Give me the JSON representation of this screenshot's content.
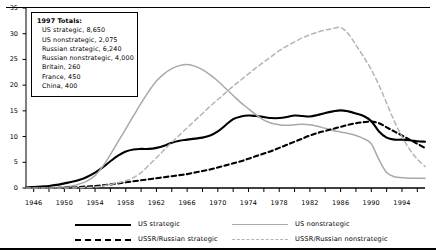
{
  "info_box": {
    "title": "1997 Totals:",
    "items": [
      "US strategic, 8,650",
      "US nonstrategic, 2,075",
      "Russian strategic, 6,240",
      "Russian nonstrategic, 4,000",
      "Britain, 260",
      "France, 450",
      "China, 400"
    ]
  },
  "legend": [
    {
      "label": "US strategic",
      "style": "solid-black"
    },
    {
      "label": "US nonstrategic",
      "style": "solid-gray"
    },
    {
      "label": "USSR/Russian strategic",
      "style": "dash-black"
    },
    {
      "label": "USSR/Russian nonstrategic",
      "style": "dash-gray"
    }
  ],
  "colors": {
    "us_strategic": "#000000",
    "us_nonstrategic": "#a9a9a9",
    "ussr_strategic": "#000000",
    "ussr_nonstrategic": "#b4b4b4",
    "axis": "#000000"
  },
  "chart_data": {
    "type": "line",
    "title": "",
    "xlabel": "",
    "ylabel": "",
    "xlim": [
      1945,
      1997
    ],
    "ylim": [
      0,
      35
    ],
    "grid": false,
    "legend_position": "bottom",
    "xticks": [
      1946,
      1950,
      1954,
      1958,
      1962,
      1966,
      1970,
      1974,
      1978,
      1982,
      1986,
      1990,
      1994
    ],
    "yticks": [
      0,
      5,
      10,
      15,
      20,
      25,
      30,
      35
    ],
    "x": [
      1945,
      1946,
      1947,
      1948,
      1949,
      1950,
      1951,
      1952,
      1953,
      1954,
      1955,
      1956,
      1957,
      1958,
      1959,
      1960,
      1961,
      1962,
      1963,
      1964,
      1965,
      1966,
      1967,
      1968,
      1969,
      1970,
      1971,
      1972,
      1973,
      1974,
      1975,
      1976,
      1977,
      1978,
      1979,
      1980,
      1981,
      1982,
      1983,
      1984,
      1985,
      1986,
      1987,
      1988,
      1989,
      1990,
      1991,
      1992,
      1993,
      1994,
      1995,
      1996,
      1997
    ],
    "series": [
      {
        "name": "US strategic",
        "style": "solid-black",
        "values": [
          0.1,
          0.2,
          0.3,
          0.4,
          0.6,
          0.9,
          1.2,
          1.6,
          2.2,
          3.0,
          4.0,
          5.2,
          6.3,
          7.1,
          7.5,
          7.6,
          7.6,
          7.8,
          8.2,
          8.8,
          9.2,
          9.4,
          9.6,
          9.8,
          10.2,
          11.0,
          12.2,
          13.4,
          13.9,
          14.1,
          14.0,
          13.8,
          13.6,
          13.6,
          13.8,
          14.1,
          14.0,
          13.9,
          14.2,
          14.6,
          14.9,
          15.1,
          14.9,
          14.5,
          14.0,
          13.0,
          11.0,
          9.8,
          9.4,
          9.4,
          9.3,
          9.1,
          9.0
        ]
      },
      {
        "name": "US nonstrategic",
        "style": "solid-gray",
        "values": [
          0.0,
          0.0,
          0.0,
          0.0,
          0.1,
          0.2,
          0.4,
          0.8,
          1.4,
          2.4,
          4.2,
          6.5,
          9.0,
          11.5,
          14.0,
          16.5,
          18.8,
          20.8,
          22.2,
          23.2,
          23.8,
          24.0,
          23.7,
          23.0,
          22.0,
          20.8,
          19.4,
          18.0,
          16.6,
          15.4,
          14.2,
          13.2,
          12.6,
          12.3,
          12.2,
          12.3,
          12.4,
          12.3,
          12.0,
          11.6,
          11.2,
          10.9,
          10.6,
          10.2,
          9.6,
          8.6,
          5.5,
          3.0,
          2.2,
          2.0,
          1.9,
          1.9,
          1.9
        ]
      },
      {
        "name": "USSR/Russian strategic",
        "style": "dash-black",
        "values": [
          0.0,
          0.0,
          0.0,
          0.0,
          0.0,
          0.05,
          0.1,
          0.2,
          0.3,
          0.4,
          0.5,
          0.7,
          0.9,
          1.1,
          1.3,
          1.5,
          1.7,
          1.9,
          2.1,
          2.3,
          2.5,
          2.7,
          3.0,
          3.3,
          3.6,
          4.0,
          4.4,
          4.8,
          5.2,
          5.7,
          6.2,
          6.7,
          7.2,
          7.8,
          8.4,
          9.0,
          9.6,
          10.2,
          10.7,
          11.1,
          11.5,
          11.9,
          12.3,
          12.6,
          12.8,
          12.9,
          12.6,
          11.8,
          11.0,
          10.2,
          9.4,
          8.6,
          7.8
        ]
      },
      {
        "name": "USSR/Russian nonstrategic",
        "style": "dash-gray",
        "values": [
          0.0,
          0.0,
          0.0,
          0.0,
          0.0,
          0.0,
          0.0,
          0.05,
          0.1,
          0.2,
          0.4,
          0.7,
          1.0,
          1.4,
          2.0,
          3.0,
          4.4,
          5.9,
          7.4,
          8.9,
          10.3,
          11.7,
          13.1,
          14.5,
          15.9,
          17.2,
          18.5,
          19.8,
          21.0,
          22.2,
          23.4,
          24.5,
          25.6,
          26.7,
          27.6,
          28.4,
          29.2,
          29.8,
          30.3,
          30.7,
          31.0,
          31.2,
          30.0,
          27.8,
          25.5,
          23.0,
          20.0,
          16.5,
          13.0,
          10.0,
          7.5,
          5.6,
          4.2
        ]
      }
    ]
  }
}
